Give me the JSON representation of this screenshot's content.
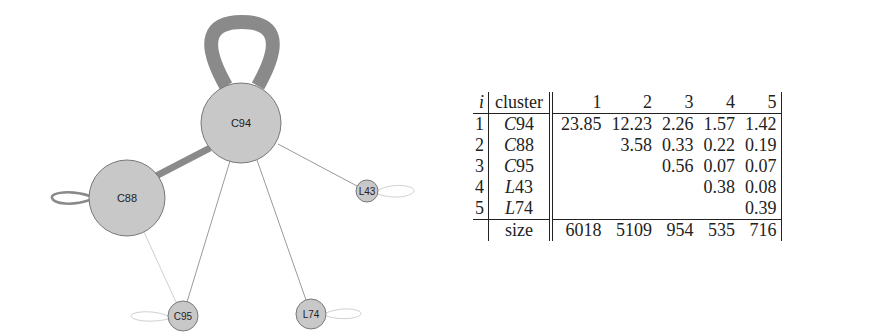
{
  "graph": {
    "nodes": [
      {
        "id": "C94",
        "label": "C94",
        "x": 241,
        "y": 123,
        "r": 40
      },
      {
        "id": "C88",
        "label": "C88",
        "x": 127,
        "y": 198,
        "r": 38
      },
      {
        "id": "L43",
        "label": "L43",
        "x": 367,
        "y": 191,
        "r": 11
      },
      {
        "id": "C95",
        "label": "C95",
        "x": 183,
        "y": 316,
        "r": 15
      },
      {
        "id": "L74",
        "label": "L74",
        "x": 311,
        "y": 314,
        "r": 15
      }
    ],
    "edges": [
      {
        "from": "C94",
        "to": "C94",
        "weight": 23.85
      },
      {
        "from": "C94",
        "to": "C88",
        "weight": 12.23
      },
      {
        "from": "C94",
        "to": "C95",
        "weight": 2.26
      },
      {
        "from": "C94",
        "to": "L43",
        "weight": 1.57
      },
      {
        "from": "C94",
        "to": "L74",
        "weight": 1.42
      },
      {
        "from": "C88",
        "to": "C88",
        "weight": 3.58
      },
      {
        "from": "C88",
        "to": "C95",
        "weight": 0.33
      }
    ],
    "colors": {
      "node_fill": "#c8c8c8",
      "node_stroke": "#777777",
      "edge": "#8a8a8a",
      "light_edge": "#bdbdbd"
    }
  },
  "table": {
    "header": {
      "i": "i",
      "cluster": "cluster",
      "cols": [
        "1",
        "2",
        "3",
        "4",
        "5"
      ]
    },
    "rows": [
      {
        "i": "1",
        "letter": "C",
        "num": "94",
        "values": [
          "23.85",
          "12.23",
          "2.26",
          "1.57",
          "1.42"
        ]
      },
      {
        "i": "2",
        "letter": "C",
        "num": "88",
        "values": [
          "",
          "3.58",
          "0.33",
          "0.22",
          "0.19"
        ]
      },
      {
        "i": "3",
        "letter": "C",
        "num": "95",
        "values": [
          "",
          "",
          "0.56",
          "0.07",
          "0.07"
        ]
      },
      {
        "i": "4",
        "letter": "L",
        "num": "43",
        "values": [
          "",
          "",
          "",
          "0.38",
          "0.08"
        ]
      },
      {
        "i": "5",
        "letter": "L",
        "num": "74",
        "values": [
          "",
          "",
          "",
          "",
          "0.39"
        ]
      }
    ],
    "footer": {
      "label": "size",
      "values": [
        "6018",
        "5109",
        "954",
        "535",
        "716"
      ]
    }
  }
}
